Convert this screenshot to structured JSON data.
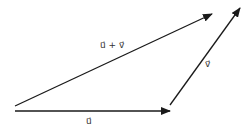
{
  "diagram": {
    "colors": {
      "stroke": "#1a1a1a",
      "label": "#333333",
      "background": "#ffffff"
    },
    "vectors": [
      {
        "id": "u",
        "label": "u⃗",
        "from": [
          15,
          111
        ],
        "to": [
          170,
          111
        ]
      },
      {
        "id": "v",
        "label": "v⃗",
        "from": [
          170,
          105
        ],
        "to": [
          240,
          8
        ]
      },
      {
        "id": "u_plus_v",
        "label": "u⃗ + v⃗",
        "from": [
          15,
          106
        ],
        "to": [
          212,
          14
        ]
      }
    ],
    "labels": {
      "u": "u⃗",
      "v": "v⃗",
      "sum": "u⃗ + v⃗"
    }
  }
}
